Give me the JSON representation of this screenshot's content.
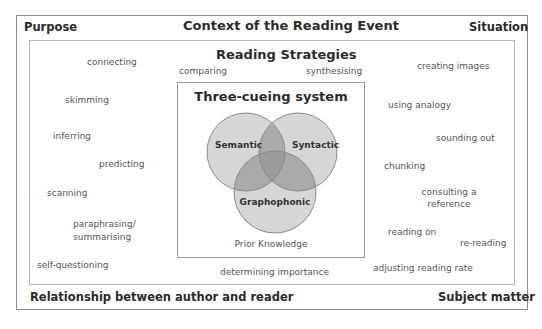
{
  "frame": {
    "title": "Context of the Reading Event",
    "corners": {
      "top_left": "Purpose",
      "top_right": "Situation",
      "bottom_left": "Relationship between author and reader",
      "bottom_right": "Subject matter"
    }
  },
  "strategies": {
    "title": "Reading Strategies",
    "items": [
      "connecting",
      "comparing",
      "synthesising",
      "creating images",
      "skimming",
      "using analogy",
      "inferring",
      "sounding out",
      "predicting",
      "chunking",
      "scanning",
      "consulting a",
      "reference",
      "paraphrasing/",
      "summarising",
      "reading on",
      "re-reading",
      "self-questioning",
      "determining importance",
      "adjusting reading rate"
    ]
  },
  "cueing_system": {
    "title": "Three-cueing system",
    "circles": [
      "Semantic",
      "Syntactic",
      "Graphophonic"
    ],
    "footer": "Prior Knowledge",
    "colors": {
      "single": "#d6d6d6",
      "double": "#aaaaaa",
      "triple": "#9c9c9c",
      "outline": "#8a8a8a"
    }
  }
}
